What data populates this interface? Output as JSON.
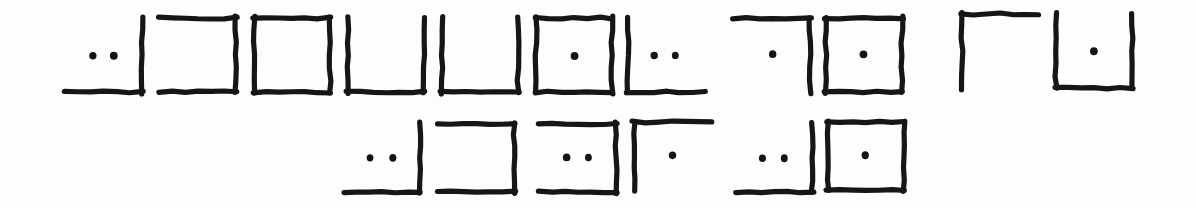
{
  "page": {
    "background_color": "#fdfdfc",
    "ink_color": "#161616",
    "width": 1196,
    "height": 208,
    "row_count": 2,
    "glyph_count": 17
  },
  "legend": {
    "edge_names": [
      "top",
      "right",
      "bottom",
      "left"
    ],
    "dot_label": "dot",
    "shape_names": {
      "full": "closed-square",
      "u": "u-shape-open-top",
      "c_right": "open-left-bracket",
      "gamma": "top-left-corner",
      "corner_br": "bottom-right-corner",
      "corner_bl": "bottom-left-corner",
      "corner_tr": "top-right-corner"
    }
  },
  "rows": [
    {
      "index": 1,
      "name": "row-1",
      "y": 12,
      "glyphs": [
        {
          "id": "r1g1",
          "name": "glyph-bottom-right-2dots",
          "shape": "corner_br",
          "edges": [
            "bottom",
            "right"
          ],
          "dots": 2,
          "x": 62,
          "y": 14,
          "w": 84,
          "h": 82,
          "label": "bottom+right, 2 dots"
        },
        {
          "id": "r1g2",
          "name": "glyph-open-left-0dots",
          "shape": "c_right",
          "edges": [
            "top",
            "right",
            "bottom"
          ],
          "dots": 0,
          "x": 156,
          "y": 14,
          "w": 84,
          "h": 82,
          "label": "top+right+bottom, 0 dots"
        },
        {
          "id": "r1g3",
          "name": "glyph-full-square-0dots",
          "shape": "full",
          "edges": [
            "top",
            "right",
            "bottom",
            "left"
          ],
          "dots": 0,
          "x": 250,
          "y": 14,
          "w": 84,
          "h": 82,
          "label": "closed square, 0 dots"
        },
        {
          "id": "r1g4",
          "name": "glyph-u-shape-0dots-a",
          "shape": "u",
          "edges": [
            "left",
            "bottom",
            "right"
          ],
          "dots": 0,
          "x": 344,
          "y": 14,
          "w": 84,
          "h": 82,
          "label": "left+bottom+right, 0 dots"
        },
        {
          "id": "r1g5",
          "name": "glyph-u-shape-0dots-b",
          "shape": "u",
          "edges": [
            "left",
            "bottom",
            "right"
          ],
          "dots": 0,
          "x": 438,
          "y": 14,
          "w": 84,
          "h": 82,
          "label": "left+bottom+right, 0 dots"
        },
        {
          "id": "r1g6",
          "name": "glyph-full-square-1dot-a",
          "shape": "full",
          "edges": [
            "top",
            "right",
            "bottom",
            "left"
          ],
          "dots": 1,
          "x": 532,
          "y": 14,
          "w": 84,
          "h": 82,
          "label": "closed square, 1 dot"
        },
        {
          "id": "r1g7",
          "name": "glyph-bottom-left-2dots",
          "shape": "corner_bl",
          "edges": [
            "left",
            "bottom"
          ],
          "dots": 2,
          "x": 624,
          "y": 14,
          "w": 84,
          "h": 82,
          "label": "left+bottom, 2 dots"
        },
        {
          "id": "r1g8",
          "name": "glyph-top-right-1dot",
          "shape": "corner_tr",
          "edges": [
            "top",
            "right"
          ],
          "dots": 1,
          "x": 730,
          "y": 14,
          "w": 84,
          "h": 82,
          "label": "top+right, 1 dot"
        },
        {
          "id": "r1g9",
          "name": "glyph-full-square-1dot-b",
          "shape": "full",
          "edges": [
            "top",
            "right",
            "bottom",
            "left"
          ],
          "dots": 1,
          "x": 822,
          "y": 14,
          "w": 84,
          "h": 82,
          "label": "closed square, 1 dot"
        },
        {
          "id": "r1g10",
          "name": "glyph-top-left-corner-0dots",
          "shape": "gamma",
          "edges": [
            "top",
            "left"
          ],
          "dots": 0,
          "x": 958,
          "y": 10,
          "w": 84,
          "h": 82,
          "label": "top+left corner, 0 dots"
        },
        {
          "id": "r1g11",
          "name": "glyph-u-shape-1dot",
          "shape": "u",
          "edges": [
            "left",
            "bottom",
            "right"
          ],
          "dots": 1,
          "x": 1052,
          "y": 10,
          "w": 84,
          "h": 82,
          "label": "left+bottom+right, 1 dot"
        }
      ]
    },
    {
      "index": 2,
      "name": "row-2",
      "y": 118,
      "glyphs": [
        {
          "id": "r2g1",
          "name": "glyph-bottom-right-2dots-r2",
          "shape": "corner_br",
          "edges": [
            "bottom",
            "right"
          ],
          "dots": 2,
          "x": 340,
          "y": 120,
          "w": 84,
          "h": 76,
          "label": "bottom+right, 2 dots"
        },
        {
          "id": "r2g2",
          "name": "glyph-open-left-0dots-r2",
          "shape": "c_right",
          "edges": [
            "top",
            "right",
            "bottom"
          ],
          "dots": 0,
          "x": 434,
          "y": 120,
          "w": 84,
          "h": 76,
          "label": "top+right+bottom, 0 dots"
        },
        {
          "id": "r2g3",
          "name": "glyph-open-left-2dots-r2",
          "shape": "c_right",
          "edges": [
            "top",
            "right",
            "bottom"
          ],
          "dots": 2,
          "x": 536,
          "y": 120,
          "w": 84,
          "h": 76,
          "label": "top+right+bottom, 2 dots"
        },
        {
          "id": "r2g4",
          "name": "glyph-top-left-corner-1dot",
          "shape": "gamma",
          "edges": [
            "top",
            "left"
          ],
          "dots": 1,
          "x": 630,
          "y": 118,
          "w": 84,
          "h": 76,
          "label": "top+left corner, 1 dot"
        },
        {
          "id": "r2g5",
          "name": "glyph-bottom-right-2dots-r2b",
          "shape": "corner_br",
          "edges": [
            "bottom",
            "right"
          ],
          "dots": 2,
          "x": 732,
          "y": 120,
          "w": 84,
          "h": 76,
          "label": "bottom+right, 2 dots"
        },
        {
          "id": "r2g6",
          "name": "glyph-full-square-1dot-r2",
          "shape": "full",
          "edges": [
            "top",
            "right",
            "bottom",
            "left"
          ],
          "dots": 1,
          "x": 824,
          "y": 118,
          "w": 84,
          "h": 76,
          "label": "closed square, 1 dot"
        }
      ]
    }
  ]
}
